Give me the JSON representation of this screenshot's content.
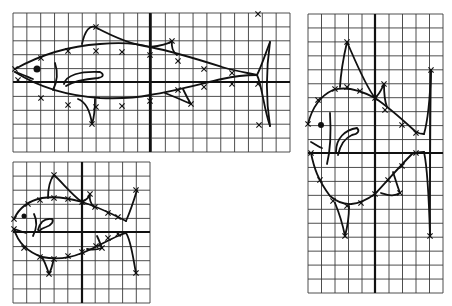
{
  "figure": {
    "width": 452,
    "height": 306,
    "colors": {
      "background": "#ffffff",
      "ink": "#111111",
      "grid": "#3a3a3a"
    }
  },
  "panels": [
    {
      "id": "top",
      "grid": {
        "x0": 13,
        "y0": 13,
        "x1": 290,
        "y1": 152,
        "cols": 20,
        "rows": 10,
        "axis_x": 150,
        "axis_y": 82
      },
      "fish": {
        "body_top": "M15,69 C40,55 70,46 100,44 C125,42 140,44 150,47 C175,52 200,60 222,67 C235,71 248,73 257,75",
        "body_bottom": "M15,72 C40,88 70,96 100,98 C125,99 140,97 150,95 C175,91 200,84 222,79 C235,76 248,75 257,75",
        "tail_upper": "M257,75 C262,65 266,52 270,42",
        "tail_lower": "M257,75 C262,85 264,110 270,126",
        "tail_edge": "M270,42 C266,70 266,100 270,126",
        "dorsal_fin": "M82,44 C85,30 90,25 95,27 C110,35 130,45 150,47",
        "second_dorsal": "M150,47 C160,46 168,44 172,41 C171,48 173,52 177,55",
        "pelvic_fin": "M78,99 C86,102 90,110 92,124 C95,115 95,105 95,99",
        "anal_fin": "M165,93 C175,97 182,100 191,104 C187,98 185,93 183,89",
        "mouth": "M15,72 C22,74 28,77 33,79",
        "gill": "M55,63 C58,72 57,82 53,90",
        "pectoral": "M64,84 C66,75 80,71 100,72 C104,74 104,77 98,78 C85,79 72,82 66,86",
        "eye": {
          "cx": 37,
          "cy": 69,
          "r": 3.5
        },
        "marks": [
          [
            15,
            69
          ],
          [
            41,
            58
          ],
          [
            68,
            51
          ],
          [
            96,
            51
          ],
          [
            122,
            52
          ],
          [
            150,
            55
          ],
          [
            178,
            61
          ],
          [
            204,
            69
          ],
          [
            232,
            73
          ],
          [
            258,
            14
          ],
          [
            96,
            27
          ],
          [
            172,
            41
          ],
          [
            18,
            80
          ],
          [
            41,
            98
          ],
          [
            68,
            105
          ],
          [
            96,
            107
          ],
          [
            122,
            106
          ],
          [
            150,
            101
          ],
          [
            178,
            90
          ],
          [
            204,
            87
          ],
          [
            232,
            84
          ],
          [
            258,
            84
          ],
          [
            92,
            124
          ],
          [
            191,
            104
          ],
          [
            259,
            125
          ]
        ]
      }
    },
    {
      "id": "bottom-left",
      "grid": {
        "x0": 13,
        "y0": 162,
        "x1": 150,
        "y1": 303,
        "cols": 10,
        "rows": 10,
        "axis_x": 82,
        "axis_y": 232
      },
      "fish": {
        "body_top": "M14,219 C20,206 32,200 42,198 C56,196 72,199 82,202 C95,206 108,212 118,217 C122,219 124,220 126,221",
        "body_bottom": "M14,229 C18,243 28,252 42,257 C56,260 70,258 82,253 C95,248 108,240 118,236 C122,234 124,233 126,233",
        "tail_upper": "M126,221 C130,212 134,200 137,190",
        "tail_lower": "M126,233 C131,240 133,258 136,273",
        "dorsal_fin": "M48,198 C48,188 50,180 54,175 C62,182 72,195 82,202",
        "second_dorsal": "M82,202 C86,200 89,198 90,194 C89,200 91,204 94,207",
        "pelvic_fin": "M42,257 C45,262 47,268 49,274 C52,268 53,262 54,258",
        "anal_fin": "M87,249 C92,250 96,250 102,248 C100,243 99,240 97,236",
        "mouth": "M14,229 C18,230 22,232 26,233",
        "gill": "M34,214 C37,220 37,228 33,236",
        "pectoral": "M38,230 C40,222 45,218 52,219 C54,221 52,225 46,227 C42,228 40,230 38,232",
        "eye": {
          "cx": 24,
          "cy": 216,
          "r": 2.5
        },
        "marks": [
          [
            14,
            219
          ],
          [
            28,
            204
          ],
          [
            40,
            200
          ],
          [
            54,
            198
          ],
          [
            68,
            199
          ],
          [
            82,
            202
          ],
          [
            95,
            207
          ],
          [
            108,
            213
          ],
          [
            118,
            217
          ],
          [
            136,
            190
          ],
          [
            54,
            175
          ],
          [
            90,
            194
          ],
          [
            14,
            229
          ],
          [
            24,
            248
          ],
          [
            40,
            257
          ],
          [
            54,
            259
          ],
          [
            68,
            256
          ],
          [
            82,
            252
          ],
          [
            96,
            246
          ],
          [
            108,
            238
          ],
          [
            118,
            234
          ],
          [
            136,
            273
          ],
          [
            49,
            274
          ],
          [
            102,
            248
          ]
        ]
      }
    },
    {
      "id": "right",
      "grid": {
        "x0": 308,
        "y0": 14,
        "x1": 443,
        "y1": 293,
        "cols": 10,
        "rows": 20,
        "axis_x": 375,
        "axis_y": 153
      },
      "fish": {
        "body_top": "M308,124 C312,108 320,96 333,90 C346,86 360,90 375,98 C390,108 405,122 416,132 C420,134 422,134 424,134",
        "body_bottom": "M311,153 C314,168 318,180 330,196 C344,208 358,206 375,194 C388,180 400,166 412,154 C418,152 421,152 424,152",
        "tail_upper": "M424,134 C428,120 430,100 431,70",
        "tail_lower": "M424,152 C428,170 429,200 430,236",
        "tail_edge": "M431,70 C430,120 430,180 430,236",
        "dorsal_fin": "M340,87 C341,70 344,55 347,42 C355,60 365,85 375,98",
        "second_dorsal": "M375,98 C380,94 382,88 384,84 C384,94 385,102 387,107",
        "pelvic_fin": "M335,203 C340,215 343,226 345,236 C348,225 349,215 349,206",
        "anal_fin": "M381,193 C388,195 394,197 400,193 C397,185 395,178 393,172",
        "mouth": "M311,142 C315,144 318,147 322,148",
        "gill": "M330,113 C331,130 331,148 327,164",
        "pectoral": "M336,152 C336,138 345,130 357,128 C360,131 358,134 352,135 C345,138 340,146 338,155",
        "eye": {
          "cx": 321,
          "cy": 125,
          "r": 3
        },
        "marks": [
          [
            308,
            124
          ],
          [
            318,
            100
          ],
          [
            335,
            89
          ],
          [
            347,
            87
          ],
          [
            360,
            91
          ],
          [
            375,
            98
          ],
          [
            385,
            110
          ],
          [
            402,
            125
          ],
          [
            416,
            133
          ],
          [
            431,
            70
          ],
          [
            347,
            42
          ],
          [
            384,
            84
          ],
          [
            311,
            153
          ],
          [
            320,
            180
          ],
          [
            333,
            201
          ],
          [
            347,
            206
          ],
          [
            361,
            203
          ],
          [
            375,
            194
          ],
          [
            388,
            180
          ],
          [
            402,
            166
          ],
          [
            416,
            153
          ],
          [
            430,
            236
          ],
          [
            345,
            236
          ],
          [
            400,
            193
          ]
        ]
      }
    }
  ]
}
